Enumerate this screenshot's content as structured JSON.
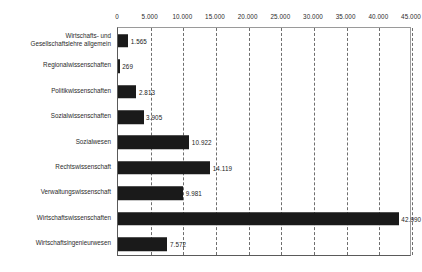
{
  "chart_data": {
    "type": "bar",
    "orientation": "horizontal",
    "title": "",
    "xlabel": "",
    "ylabel": "",
    "xlim": [
      0,
      45000
    ],
    "grid": true,
    "grid_style": "dashed-vertical",
    "legend": "none",
    "axis_position": "top",
    "number_format": "de-DE (period thousands separator)",
    "bar_color": "#1a1a1a",
    "tick_values": [
      0,
      5000,
      10000,
      15000,
      20000,
      25000,
      30000,
      35000,
      40000,
      45000
    ],
    "tick_labels": [
      "0",
      "5.000",
      "10.000",
      "15.000",
      "20.000",
      "25.000",
      "30.000",
      "35.000",
      "40.000",
      "45.000"
    ],
    "categories": [
      "Wirtschafts- und Gesellschaftslehre allgemein",
      "Regionalwissenschaften",
      "Politikwissenschaften",
      "Sozialwissenschaften",
      "Sozialwesen",
      "Rechtswissenschaft",
      "Verwaltungswissenschaft",
      "Wirtschaftswissenschaften",
      "Wirtschaftsingenieurwesen"
    ],
    "values": [
      1565,
      269,
      2813,
      3905,
      10922,
      14119,
      9981,
      42990,
      7572
    ],
    "value_labels": [
      "1.565",
      "269",
      "2.813",
      "3.905",
      "10.922",
      "14.119",
      "9.981",
      "42.990",
      "7.572"
    ]
  },
  "rows": [
    {
      "label_line1": "Wirtschafts- und",
      "label_line2": "Gesellschaftslehre allgemein",
      "value_label": "1.565"
    },
    {
      "label_line1": "Regionalwissenschaften",
      "label_line2": "",
      "value_label": "269"
    },
    {
      "label_line1": "Politikwissenschaften",
      "label_line2": "",
      "value_label": "2.813"
    },
    {
      "label_line1": "Sozialwissenschaften",
      "label_line2": "",
      "value_label": "3.905"
    },
    {
      "label_line1": "Sozialwesen",
      "label_line2": "",
      "value_label": "10.922"
    },
    {
      "label_line1": "Rechtswissenschaft",
      "label_line2": "",
      "value_label": "14.119"
    },
    {
      "label_line1": "Verwaltungswissenschaft",
      "label_line2": "",
      "value_label": "9.981"
    },
    {
      "label_line1": "Wirtschaftswissenschaften",
      "label_line2": "",
      "value_label": "42.990"
    },
    {
      "label_line1": "Wirtschaftsingenieurwesen",
      "label_line2": "",
      "value_label": "7.572"
    }
  ]
}
